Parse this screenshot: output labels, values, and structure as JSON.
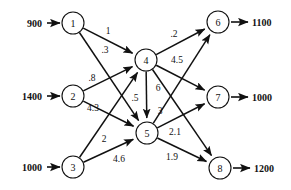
{
  "diagram": {
    "type": "directed-graph",
    "colors": {
      "stroke": "#111111",
      "background": "#ffffff"
    }
  },
  "nodes": [
    {
      "id": "1",
      "label": "1",
      "cx": 73,
      "cy": 23,
      "r": 11
    },
    {
      "id": "2",
      "label": "2",
      "cx": 73,
      "cy": 96,
      "r": 11
    },
    {
      "id": "3",
      "label": "3",
      "cx": 73,
      "cy": 167,
      "r": 11
    },
    {
      "id": "4",
      "label": "4",
      "cx": 146,
      "cy": 60,
      "r": 11
    },
    {
      "id": "5",
      "label": "5",
      "cx": 147,
      "cy": 133,
      "r": 11
    },
    {
      "id": "6",
      "label": "6",
      "cx": 218,
      "cy": 22,
      "r": 11
    },
    {
      "id": "7",
      "label": "7",
      "cx": 218,
      "cy": 97,
      "r": 11
    },
    {
      "id": "8",
      "label": "8",
      "cx": 220,
      "cy": 168,
      "r": 11
    }
  ],
  "inputs": [
    {
      "value": "900",
      "text_x": 42,
      "text_y": 23,
      "line_x1": 47,
      "line_x2": 60,
      "line_y": 23
    },
    {
      "value": "1400",
      "text_x": 42,
      "text_y": 96,
      "line_x1": 47,
      "line_x2": 60,
      "line_y": 96
    },
    {
      "value": "1000",
      "text_x": 42,
      "text_y": 167,
      "line_x1": 47,
      "line_x2": 60,
      "line_y": 167
    }
  ],
  "outputs": [
    {
      "value": "1100",
      "text_x": 252,
      "text_y": 22,
      "line_x1": 231,
      "line_x2": 248,
      "line_y": 22
    },
    {
      "value": "1000",
      "text_x": 252,
      "text_y": 97,
      "line_x1": 231,
      "line_x2": 248,
      "line_y": 97
    },
    {
      "value": "1200",
      "text_x": 254,
      "text_y": 168,
      "line_x1": 233,
      "line_x2": 250,
      "line_y": 168
    }
  ],
  "edges": [
    {
      "from": "1",
      "to": "4",
      "weight": "1",
      "lx": 108,
      "ly": 31
    },
    {
      "from": "1",
      "to": "5",
      "weight": ".3",
      "lx": 105,
      "ly": 50
    },
    {
      "from": "2",
      "to": "4",
      "weight": ".8",
      "lx": 92,
      "ly": 78
    },
    {
      "from": "2",
      "to": "5",
      "weight": "4.3",
      "lx": 93,
      "ly": 108
    },
    {
      "from": "3",
      "to": "4",
      "weight": "2",
      "lx": 104,
      "ly": 139
    },
    {
      "from": "3",
      "to": "5",
      "weight": "4.6",
      "lx": 119,
      "ly": 159
    },
    {
      "from": "4",
      "to": "5",
      "weight": ".5",
      "lx": 135,
      "ly": 98
    },
    {
      "from": "4",
      "to": "6",
      "weight": ".2",
      "lx": 174,
      "ly": 34
    },
    {
      "from": "4",
      "to": "7",
      "weight": "4.5",
      "lx": 177,
      "ly": 60
    },
    {
      "from": "4",
      "to": "8",
      "weight": "6",
      "lx": 158,
      "ly": 88
    },
    {
      "from": "5",
      "to": "6",
      "weight": "3",
      "lx": 160,
      "ly": 111
    },
    {
      "from": "5",
      "to": "7",
      "weight": "2.1",
      "lx": 175,
      "ly": 132
    },
    {
      "from": "5",
      "to": "8",
      "weight": "1.9",
      "lx": 172,
      "ly": 157
    }
  ]
}
